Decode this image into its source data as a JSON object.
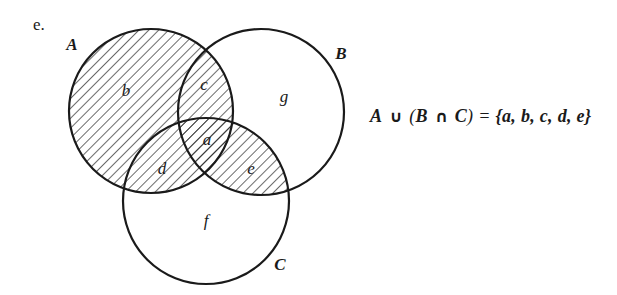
{
  "part_label": "e.",
  "sets": {
    "A": {
      "label": "A",
      "cx": 151,
      "cy": 111,
      "r": 82
    },
    "B": {
      "label": "B",
      "cx": 261,
      "cy": 112,
      "r": 83
    },
    "C": {
      "label": "C",
      "cx": 206,
      "cy": 201,
      "r": 83
    }
  },
  "set_labels": {
    "A": {
      "text": "A",
      "x": 72,
      "y": 46
    },
    "B": {
      "text": "B",
      "x": 341,
      "y": 55
    },
    "C": {
      "text": "C",
      "x": 280,
      "y": 266
    }
  },
  "regions": [
    {
      "id": "a",
      "label": "a",
      "x": 207,
      "y": 141,
      "shaded": true,
      "desc": "A∩B∩C"
    },
    {
      "id": "b",
      "label": "b",
      "x": 126,
      "y": 92,
      "shaded": true,
      "desc": "A only"
    },
    {
      "id": "c",
      "label": "c",
      "x": 204,
      "y": 86,
      "shaded": true,
      "desc": "A∩B not C"
    },
    {
      "id": "d",
      "label": "d",
      "x": 162,
      "y": 170,
      "shaded": true,
      "desc": "A∩C not B"
    },
    {
      "id": "e",
      "label": "e",
      "x": 251,
      "y": 170,
      "shaded": true,
      "desc": "B∩C not A"
    },
    {
      "id": "f",
      "label": "f",
      "x": 206,
      "y": 222,
      "shaded": false,
      "desc": "C only"
    },
    {
      "id": "g",
      "label": "g",
      "x": 284,
      "y": 98,
      "shaded": false,
      "desc": "B only"
    }
  ],
  "shading": {
    "pattern": "diagonal-hatch",
    "shaded_expression": "A ∪ (B ∩ C)",
    "color": "#1a1a1a"
  },
  "formula": {
    "lhs_A": "A",
    "union": "∪",
    "open_paren": "(",
    "lhs_B": "B",
    "intersect": "∩",
    "lhs_C": "C",
    "close_paren": ")",
    "equals": " = ",
    "rhs": "{a, b, c, d, e}"
  }
}
